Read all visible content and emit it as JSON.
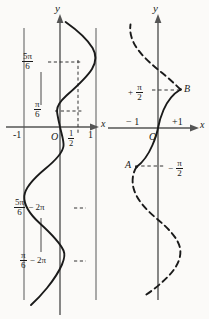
{
  "figure": {
    "type": "diagram",
    "background_color": "#fbfaf8",
    "ink_color": "#1a1a1a",
    "axis_color": "#555555"
  },
  "left_panel": {
    "name": "multivalued-arcsine-panel",
    "axis_labels": {
      "x": "x",
      "y": "y"
    },
    "origin_label": "O",
    "x_ticks": [
      {
        "label": "-1",
        "value": -1
      },
      {
        "label": "1",
        "value": 1
      }
    ],
    "x_tick_fraction": {
      "num": "1",
      "den": "2",
      "value": 0.5
    },
    "y_value_labels": [
      {
        "num": "5π",
        "den": "6",
        "suffix": "",
        "value": 2.618
      },
      {
        "num": "π",
        "den": "6",
        "suffix": "",
        "value": 0.524
      },
      {
        "num": "5π",
        "den": "6",
        "suffix": "− 2π",
        "value": -3.665
      },
      {
        "num": "π",
        "den": "6",
        "suffix": "− 2π",
        "value": -5.76
      }
    ],
    "bounding_lines": [
      -1,
      1
    ],
    "dashed_vertical_at": 0.5,
    "curve_style": "solid"
  },
  "right_panel": {
    "name": "principal-branch-panel",
    "axis_labels": {
      "x": "x",
      "y": "y"
    },
    "origin_label": "O",
    "x_ticks": [
      {
        "label": "− 1",
        "value": -1
      },
      {
        "label": "+1",
        "value": 1
      }
    ],
    "y_marks": [
      {
        "sign": "+",
        "num": "π",
        "den": "2",
        "point": "B",
        "value": 1.5708
      },
      {
        "sign": "−",
        "num": "π",
        "den": "2",
        "point": "A",
        "value": -1.5708
      }
    ],
    "points": [
      {
        "label": "B",
        "x": 1,
        "y": 1.5708
      },
      {
        "label": "A",
        "x": -1,
        "y": -1.5708
      }
    ],
    "principal_branch_style": "solid",
    "other_branches_style": "dashed"
  }
}
